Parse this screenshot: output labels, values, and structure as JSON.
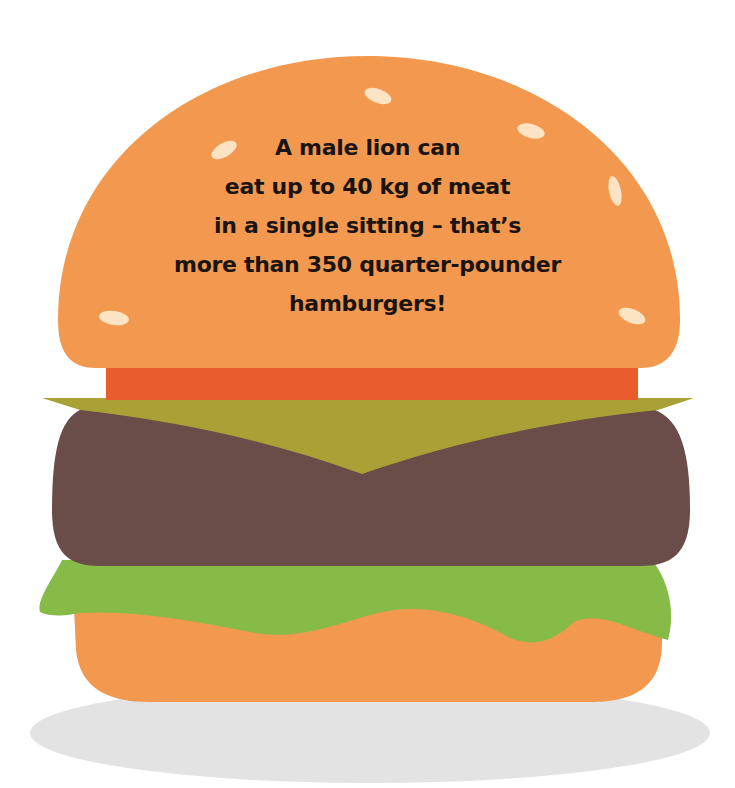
{
  "illustration": {
    "subject": "hamburger",
    "caption_lines": [
      "A male lion can",
      "eat up to 40 kg of meat",
      "in a single sitting – that’s",
      "more than 350 quarter-pounder",
      "hamburgers!"
    ],
    "colors": {
      "background": "#ffffff",
      "bun": "#f3994f",
      "sesame": "#fbe3c4",
      "tomato": "#e85c2e",
      "cheese": "#a9a136",
      "patty": "#6a4c48",
      "lettuce": "#86bb48",
      "shadow": "#e3e3e3",
      "text": "#1a1410"
    },
    "layers": [
      {
        "name": "shadow"
      },
      {
        "name": "bottom-bun"
      },
      {
        "name": "lettuce"
      },
      {
        "name": "patty"
      },
      {
        "name": "cheese"
      },
      {
        "name": "tomato"
      },
      {
        "name": "top-bun"
      }
    ],
    "sesame_seeds": [
      {
        "cx": 378,
        "cy": 96,
        "rx": 14,
        "ry": 7,
        "rot": 20
      },
      {
        "cx": 531,
        "cy": 131,
        "rx": 14,
        "ry": 7,
        "rot": 15
      },
      {
        "cx": 224,
        "cy": 150,
        "rx": 14,
        "ry": 7,
        "rot": -30
      },
      {
        "cx": 615,
        "cy": 191,
        "rx": 15,
        "ry": 6,
        "rot": 78
      },
      {
        "cx": 114,
        "cy": 318,
        "rx": 15,
        "ry": 7,
        "rot": 8
      },
      {
        "cx": 632,
        "cy": 316,
        "rx": 14,
        "ry": 7,
        "rot": 22
      }
    ]
  }
}
